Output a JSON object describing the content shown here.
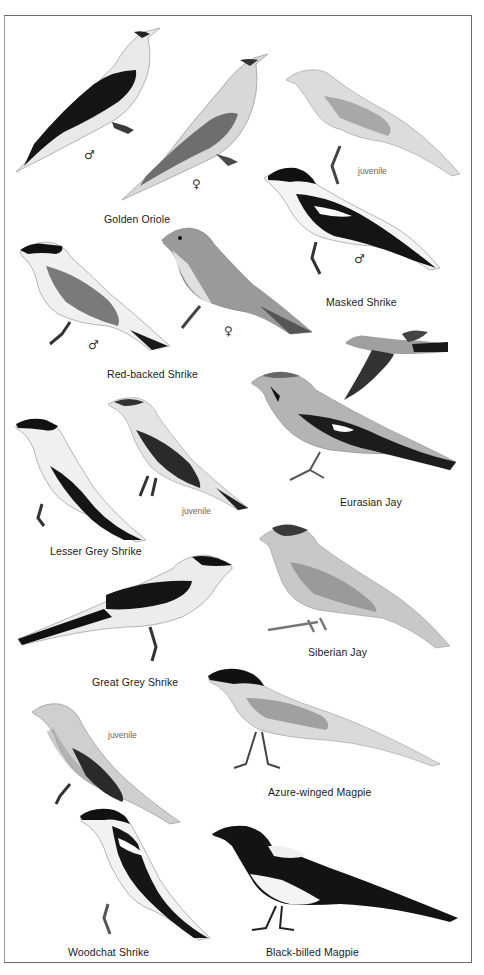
{
  "plate": {
    "species": [
      {
        "name": "Golden Oriole",
        "notes": [
          "♂",
          "♀"
        ]
      },
      {
        "name": "Masked Shrike",
        "notes": [
          "juvenile",
          "♂"
        ]
      },
      {
        "name": "Red-backed Shrike",
        "notes": [
          "♂",
          "♀"
        ]
      },
      {
        "name": "Eurasian Jay",
        "notes": []
      },
      {
        "name": "Lesser Grey Shrike",
        "notes": [
          "juvenile"
        ]
      },
      {
        "name": "Siberian Jay",
        "notes": []
      },
      {
        "name": "Great Grey Shrike",
        "notes": []
      },
      {
        "name": "Azure-winged Magpie",
        "notes": []
      },
      {
        "name": "Woodchat Shrike",
        "notes": [
          "juvenile"
        ]
      },
      {
        "name": "Black-billed Magpie",
        "notes": []
      }
    ],
    "symbols": {
      "male": "♂",
      "female": "♀",
      "juvenile": "juvenile"
    }
  }
}
